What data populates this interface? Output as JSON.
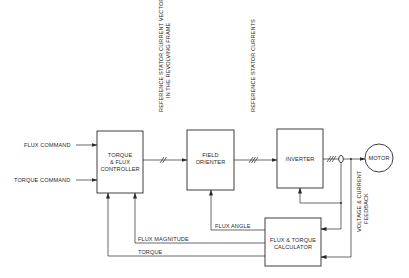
{
  "diagram": {
    "type": "block-diagram",
    "blocks": [
      {
        "id": "controller",
        "lines": [
          "TORQUE",
          "& FLUX",
          "CONTROLLER"
        ]
      },
      {
        "id": "orienter",
        "lines": [
          "FIELD",
          "ORIENTER"
        ]
      },
      {
        "id": "inverter",
        "lines": [
          "INVERTER"
        ]
      },
      {
        "id": "motor",
        "lines": [
          "MOTOR"
        ]
      },
      {
        "id": "calculator",
        "lines": [
          "FLUX & TORQUE",
          "CALCULATOR"
        ]
      }
    ],
    "inputs": {
      "flux_command": "FLUX COMMAND",
      "torque_command": "TORQUE COMMAND"
    },
    "signals": {
      "ref_vector_line1": "REFERENCE STATOR CURRENT VECTOR",
      "ref_vector_line2": "IN THE REVOLVING FRAME",
      "ref_currents": "REFERENCE STATOR CURRENTS",
      "feedback_line1": "VOLTAGE & CURRENT",
      "feedback_line2": "FEEDBACK",
      "flux_angle": "FLUX ANGLE",
      "flux_magnitude": "FLUX MAGNITUDE",
      "torque": "TORQUE"
    }
  }
}
